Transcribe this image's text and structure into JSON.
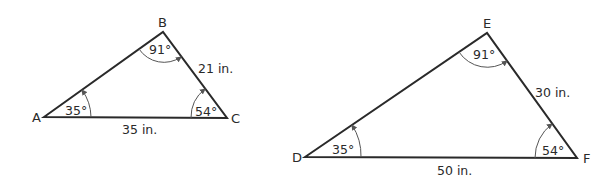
{
  "figure": {
    "colors": {
      "line": "#2a2a2a",
      "arc": "#555555",
      "background": "#ffffff"
    },
    "triangles": [
      {
        "name": "ABC",
        "vertices": {
          "A": {
            "label": "A",
            "angle": "35°"
          },
          "B": {
            "label": "B",
            "angle": "91°"
          },
          "C": {
            "label": "C",
            "angle": "54°"
          }
        },
        "sides": {
          "BC": "21 in.",
          "AC": "35 in."
        }
      },
      {
        "name": "DEF",
        "vertices": {
          "D": {
            "label": "D",
            "angle": "35°"
          },
          "E": {
            "label": "E",
            "angle": "91°"
          },
          "F": {
            "label": "F",
            "angle": "54°"
          }
        },
        "sides": {
          "EF": "30 in.",
          "DF": "50 in."
        }
      }
    ]
  }
}
